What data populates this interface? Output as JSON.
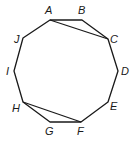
{
  "diagram": {
    "shape": "decagon",
    "vertices": [
      {
        "name": "A",
        "x": 50,
        "y": 20,
        "lx": 45,
        "ly": 14
      },
      {
        "name": "B",
        "x": 82,
        "y": 20,
        "lx": 78,
        "ly": 14
      },
      {
        "name": "C",
        "x": 108,
        "y": 39,
        "lx": 110,
        "ly": 43
      },
      {
        "name": "D",
        "x": 118,
        "y": 71,
        "lx": 121,
        "ly": 75
      },
      {
        "name": "E",
        "x": 108,
        "y": 102,
        "lx": 110,
        "ly": 110
      },
      {
        "name": "F",
        "x": 81,
        "y": 122,
        "lx": 77,
        "ly": 135
      },
      {
        "name": "G",
        "x": 50,
        "y": 122,
        "lx": 45,
        "ly": 135
      },
      {
        "name": "H",
        "x": 23,
        "y": 102,
        "lx": 12,
        "ly": 112
      },
      {
        "name": "I",
        "x": 14,
        "y": 71,
        "lx": 6,
        "ly": 75
      },
      {
        "name": "J",
        "x": 23,
        "y": 38,
        "lx": 14,
        "ly": 43
      }
    ],
    "diagonals": [
      {
        "from": "A",
        "to": "C"
      },
      {
        "from": "H",
        "to": "F"
      }
    ],
    "labels": {
      "A": "A",
      "B": "B",
      "C": "C",
      "D": "D",
      "E": "E",
      "F": "F",
      "G": "G",
      "H": "H",
      "I": "I",
      "J": "J"
    }
  }
}
